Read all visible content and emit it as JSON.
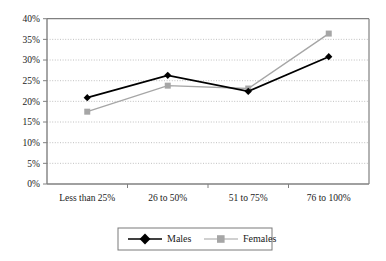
{
  "chart_data": {
    "type": "line",
    "title": "",
    "subtitle": "",
    "xlabel": "",
    "ylabel": "",
    "categories": [
      "Less than 25%",
      "26 to 50%",
      "51 to 75%",
      "76 to 100%"
    ],
    "series": [
      {
        "name": "Males",
        "values": [
          20.9,
          26.3,
          22.4,
          30.8
        ],
        "color": "#000000",
        "marker": "diamond"
      },
      {
        "name": "Females",
        "values": [
          17.5,
          23.8,
          23.1,
          36.4
        ],
        "color": "#a6a6a6",
        "marker": "square"
      }
    ],
    "ylim": [
      0,
      40
    ],
    "ytick_values": [
      0,
      5,
      10,
      15,
      20,
      25,
      30,
      35,
      40
    ],
    "ytick_labels": [
      "0%",
      "5%",
      "10%",
      "15%",
      "20%",
      "25%",
      "30%",
      "35%",
      "40%"
    ],
    "grid": true,
    "grid_axis": "y",
    "grid_style": "dotted",
    "legend_position": "bottom",
    "plot_border": true,
    "background_color": "#ffffff",
    "axis_color": "#808080",
    "grid_color": "#b0b0b0"
  },
  "legend": {
    "entries": [
      {
        "label": "Males"
      },
      {
        "label": "Females"
      }
    ]
  },
  "axis": {
    "y_ticks": [
      "40%",
      "35%",
      "30%",
      "25%",
      "20%",
      "15%",
      "10%",
      "5%",
      "0%"
    ],
    "x_categories": [
      "Less than 25%",
      "26 to 50%",
      "51 to 75%",
      "76 to 100%"
    ]
  }
}
